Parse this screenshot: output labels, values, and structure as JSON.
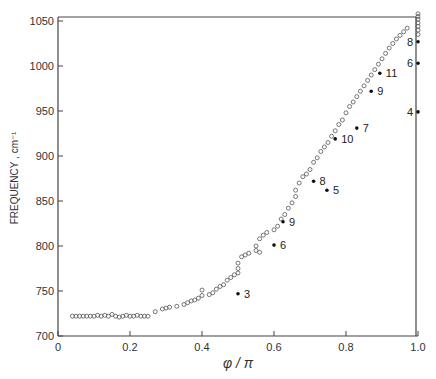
{
  "chart_data": {
    "type": "scatter",
    "title": "",
    "xlabel": "φ / π",
    "ylabel": "FREQUENCY , cm⁻¹",
    "xlim": [
      0,
      1.0
    ],
    "ylim": [
      700,
      1060
    ],
    "xticks": [
      0,
      0.2,
      0.4,
      0.6,
      0.8,
      1.0
    ],
    "xtick_labels": [
      "0",
      "0.2",
      "0.4",
      "0.6",
      "0.8",
      "1.0"
    ],
    "yticks": [
      700,
      750,
      800,
      850,
      900,
      950,
      1000,
      1050
    ],
    "ytick_labels": [
      "700",
      "750",
      "800",
      "850",
      "900",
      "950",
      "1000",
      "1050"
    ],
    "grid": false,
    "legend": null,
    "series": [
      {
        "name": "calculated (open circles)",
        "marker": "open-circle",
        "points": [
          [
            0.04,
            722
          ],
          [
            0.05,
            722
          ],
          [
            0.06,
            722
          ],
          [
            0.07,
            722
          ],
          [
            0.08,
            722
          ],
          [
            0.09,
            722
          ],
          [
            0.1,
            722
          ],
          [
            0.11,
            723
          ],
          [
            0.12,
            722
          ],
          [
            0.13,
            723
          ],
          [
            0.14,
            722
          ],
          [
            0.15,
            724
          ],
          [
            0.16,
            722
          ],
          [
            0.17,
            721
          ],
          [
            0.18,
            722
          ],
          [
            0.19,
            723
          ],
          [
            0.2,
            722
          ],
          [
            0.21,
            722
          ],
          [
            0.22,
            723
          ],
          [
            0.23,
            722
          ],
          [
            0.24,
            722
          ],
          [
            0.25,
            722
          ],
          [
            0.27,
            727
          ],
          [
            0.29,
            730
          ],
          [
            0.3,
            731
          ],
          [
            0.31,
            732
          ],
          [
            0.33,
            733
          ],
          [
            0.35,
            735
          ],
          [
            0.36,
            737
          ],
          [
            0.37,
            739
          ],
          [
            0.38,
            740
          ],
          [
            0.39,
            742
          ],
          [
            0.4,
            745
          ],
          [
            0.4,
            751
          ],
          [
            0.42,
            746
          ],
          [
            0.43,
            748
          ],
          [
            0.44,
            752
          ],
          [
            0.45,
            755
          ],
          [
            0.46,
            757
          ],
          [
            0.47,
            762
          ],
          [
            0.48,
            765
          ],
          [
            0.49,
            768
          ],
          [
            0.5,
            770
          ],
          [
            0.5,
            775
          ],
          [
            0.5,
            781
          ],
          [
            0.51,
            788
          ],
          [
            0.52,
            790
          ],
          [
            0.53,
            792
          ],
          [
            0.55,
            795
          ],
          [
            0.56,
            793
          ],
          [
            0.55,
            800
          ],
          [
            0.56,
            808
          ],
          [
            0.57,
            812
          ],
          [
            0.58,
            815
          ],
          [
            0.6,
            818
          ],
          [
            0.61,
            822
          ],
          [
            0.62,
            830
          ],
          [
            0.63,
            835
          ],
          [
            0.64,
            842
          ],
          [
            0.65,
            848
          ],
          [
            0.66,
            855
          ],
          [
            0.66,
            862
          ],
          [
            0.67,
            870
          ],
          [
            0.68,
            877
          ],
          [
            0.69,
            880
          ],
          [
            0.7,
            885
          ],
          [
            0.71,
            893
          ],
          [
            0.72,
            898
          ],
          [
            0.73,
            905
          ],
          [
            0.74,
            910
          ],
          [
            0.75,
            915
          ],
          [
            0.76,
            922
          ],
          [
            0.77,
            928
          ],
          [
            0.78,
            935
          ],
          [
            0.79,
            940
          ],
          [
            0.8,
            948
          ],
          [
            0.81,
            955
          ],
          [
            0.82,
            960
          ],
          [
            0.83,
            966
          ],
          [
            0.84,
            972
          ],
          [
            0.85,
            978
          ],
          [
            0.86,
            984
          ],
          [
            0.87,
            990
          ],
          [
            0.88,
            996
          ],
          [
            0.89,
            1002
          ],
          [
            0.9,
            1008
          ],
          [
            0.91,
            1014
          ],
          [
            0.92,
            1020
          ],
          [
            0.93,
            1025
          ],
          [
            0.94,
            1030
          ],
          [
            0.95,
            1034
          ],
          [
            0.96,
            1038
          ],
          [
            0.97,
            1042
          ],
          [
            1.0,
            1035
          ],
          [
            1.0,
            1040
          ],
          [
            1.0,
            1044
          ],
          [
            1.0,
            1048
          ],
          [
            1.0,
            1052
          ],
          [
            1.0,
            1055
          ],
          [
            1.0,
            1058
          ]
        ]
      },
      {
        "name": "observed (filled points, labeled)",
        "marker": "filled-dot",
        "points": [
          {
            "x": 0.5,
            "y": 747,
            "label": "3"
          },
          {
            "x": 0.6,
            "y": 801,
            "label": "6"
          },
          {
            "x": 0.625,
            "y": 827,
            "label": "9"
          },
          {
            "x": 0.71,
            "y": 872,
            "label": "8"
          },
          {
            "x": 0.747,
            "y": 862,
            "label": "5"
          },
          {
            "x": 0.77,
            "y": 919,
            "label": "10"
          },
          {
            "x": 0.83,
            "y": 931,
            "label": "7"
          },
          {
            "x": 0.87,
            "y": 972,
            "label": "9"
          },
          {
            "x": 0.894,
            "y": 992,
            "label": "11"
          },
          {
            "x": 1.0,
            "y": 949,
            "label": "4"
          },
          {
            "x": 1.0,
            "y": 1003,
            "label": "6"
          },
          {
            "x": 1.0,
            "y": 1027,
            "label": "8"
          }
        ]
      }
    ]
  }
}
